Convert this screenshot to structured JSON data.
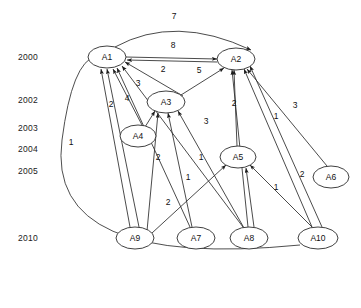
{
  "figure": {
    "type": "directed-graph",
    "title": "",
    "background": "#ffffff",
    "stroke_color": "#2b2b2b"
  },
  "timeline": {
    "axis_label": "",
    "years": [
      {
        "label": "2000",
        "y": 57
      },
      {
        "label": "2002",
        "y": 100
      },
      {
        "label": "2003",
        "y": 128
      },
      {
        "label": "2004",
        "y": 149
      },
      {
        "label": "2005",
        "y": 171
      },
      {
        "label": "2010",
        "y": 238
      }
    ]
  },
  "nodes": [
    {
      "id": "A1",
      "label": "A1",
      "cx": 107,
      "cy": 57,
      "rx": 19,
      "ry": 11,
      "year": "2000"
    },
    {
      "id": "A2",
      "label": "A2",
      "cx": 236,
      "cy": 59,
      "rx": 19,
      "ry": 11,
      "year": "2000"
    },
    {
      "id": "A3",
      "label": "A3",
      "cx": 166,
      "cy": 102,
      "rx": 19,
      "ry": 11,
      "year": "2002"
    },
    {
      "id": "A4",
      "label": "A4",
      "cx": 138,
      "cy": 136,
      "rx": 18,
      "ry": 11,
      "year": "2003"
    },
    {
      "id": "A5",
      "label": "A5",
      "cx": 238,
      "cy": 157,
      "rx": 18,
      "ry": 11,
      "year": "2004"
    },
    {
      "id": "A6",
      "label": "A6",
      "cx": 331,
      "cy": 177,
      "rx": 18,
      "ry": 11,
      "year": "2005"
    },
    {
      "id": "A9",
      "label": "A9",
      "cx": 135,
      "cy": 238,
      "rx": 19,
      "ry": 11,
      "year": "2010"
    },
    {
      "id": "A7",
      "label": "A7",
      "cx": 196,
      "cy": 238,
      "rx": 19,
      "ry": 11,
      "year": "2010"
    },
    {
      "id": "A8",
      "label": "A8",
      "cx": 249,
      "cy": 238,
      "rx": 19,
      "ry": 11,
      "year": "2010"
    },
    {
      "id": "A10",
      "label": "A10",
      "cx": 318,
      "cy": 238,
      "rx": 20,
      "ry": 11,
      "year": "2010"
    }
  ],
  "edges": [
    {
      "from": "A1",
      "to": "A2",
      "weight": "7",
      "label_x": 174,
      "label_y": 19,
      "path": "M 115 47 Q 175 14 251 50",
      "arrow_at": [
        251,
        50
      ],
      "arrow_angle": 38
    },
    {
      "from": "A1",
      "to": "A2",
      "weight": "8",
      "label_x": 173,
      "label_y": 48,
      "path": "M 126 57 L 217 59",
      "arrow_at": [
        217,
        59
      ],
      "arrow_angle": 1
    },
    {
      "from": "A2",
      "to": "A1",
      "weight": "",
      "label_x": 0,
      "label_y": 0,
      "path": "M 217 62 L 127 60",
      "arrow_at": [
        127,
        60
      ],
      "arrow_angle": 181
    },
    {
      "from": "A3",
      "to": "A1",
      "weight": "2",
      "label_x": 163,
      "label_y": 72,
      "path": "M 183 96 L 125 62",
      "arrow_at": [
        125,
        62
      ],
      "arrow_angle": 210
    },
    {
      "from": "A3",
      "to": "A2",
      "weight": "5",
      "label_x": 199,
      "label_y": 73,
      "path": "M 181 95 L 224 68",
      "arrow_at": [
        224,
        68
      ],
      "arrow_angle": 328
    },
    {
      "from": "A4",
      "to": "A1",
      "weight": "3",
      "label_x": 138,
      "label_y": 86,
      "path": "M 142 125 L 113 69",
      "arrow_at": [
        113,
        69
      ],
      "arrow_angle": 243
    },
    {
      "from": "A4",
      "to": "A3",
      "weight": "",
      "label_x": 0,
      "label_y": 0,
      "path": "M 145 127 L 155 111",
      "arrow_at": [
        155,
        111
      ],
      "arrow_angle": 302
    },
    {
      "from": "A9",
      "to": "A1",
      "weight": "2",
      "label_x": 111,
      "label_y": 107,
      "path": "M 130 227 L 101 69",
      "arrow_at": [
        101,
        69
      ],
      "arrow_angle": 243
    },
    {
      "from": "A9",
      "to": "A1",
      "weight": "4",
      "label_x": 127,
      "label_y": 101,
      "path": "M 139 227 L 107 69",
      "arrow_at": [
        107,
        69
      ],
      "arrow_angle": 258
    },
    {
      "from": "A9",
      "to": "A3",
      "weight": "2",
      "label_x": 158,
      "label_y": 160,
      "path": "M 147 231 L 158 113",
      "arrow_at": [
        158,
        113
      ],
      "arrow_angle": 265
    },
    {
      "from": "A7",
      "to": "A1",
      "weight": "",
      "label_x": 0,
      "label_y": 0,
      "path": "M 190 227 L 117 68",
      "arrow_at": [
        117,
        68
      ],
      "arrow_angle": 219
    },
    {
      "from": "A7",
      "to": "A3",
      "weight": "1",
      "label_x": 188,
      "label_y": 180,
      "path": "M 192 227 L 168 113",
      "arrow_at": [
        168,
        113
      ],
      "arrow_angle": 258
    },
    {
      "from": "A8",
      "to": "A1",
      "weight": "3",
      "label_x": 206,
      "label_y": 124,
      "path": "M 243 227 L 122 66",
      "arrow_at": [
        122,
        66
      ],
      "arrow_angle": 233
    },
    {
      "from": "A8",
      "to": "A3",
      "weight": "",
      "label_x": 0,
      "label_y": 0,
      "path": "M 244 228 L 178 111",
      "arrow_at": [
        178,
        111
      ],
      "arrow_angle": 240
    },
    {
      "from": "A8",
      "to": "A2",
      "weight": "2",
      "label_x": 234,
      "label_y": 106,
      "path": "M 248 227 L 232 70",
      "arrow_at": [
        232,
        70
      ],
      "arrow_angle": 254
    },
    {
      "from": "A8",
      "to": "A5",
      "weight": "1",
      "label_x": 276,
      "label_y": 190,
      "path": "M 254 227 L 246 168",
      "arrow_at": [
        246,
        168
      ],
      "arrow_angle": 262
    },
    {
      "from": "A10",
      "to": "A1",
      "weight": "1",
      "label_x": 71,
      "label_y": 145,
      "path": "M 300 245 Q 45 270 62 140 Q 72 62 96 56",
      "arrow_at": [
        96,
        56
      ],
      "arrow_angle": 350
    },
    {
      "from": "A10",
      "to": "A2",
      "weight": "1",
      "label_x": 276,
      "label_y": 119,
      "path": "M 312 227 L 244 69",
      "arrow_at": [
        244,
        69
      ],
      "arrow_angle": 247
    },
    {
      "from": "A10",
      "to": "A2",
      "weight": "3",
      "label_x": 295,
      "label_y": 108,
      "path": "M 322 227 L 250 66",
      "arrow_at": [
        250,
        66
      ],
      "arrow_angle": 246
    },
    {
      "from": "A10",
      "to": "A5",
      "weight": "2",
      "label_x": 302,
      "label_y": 177,
      "path": "M 312 227 L 250 165",
      "arrow_at": [
        250,
        165
      ],
      "arrow_angle": 225
    },
    {
      "from": "A6",
      "to": "A2",
      "weight": "",
      "label_x": 0,
      "label_y": 0,
      "path": "M 327 166 L 247 69",
      "arrow_at": [
        247,
        69
      ],
      "arrow_angle": 230
    },
    {
      "from": "A5",
      "to": "A2",
      "weight": "1",
      "label_x": 201,
      "label_y": 160,
      "path": "M 237 146 L 234 70",
      "arrow_at": [
        234,
        70
      ],
      "arrow_angle": 268
    },
    {
      "from": "A9",
      "to": "A5",
      "weight": "2",
      "label_x": 168,
      "label_y": 205,
      "path": "M 152 233 L 226 165",
      "arrow_at": [
        226,
        165
      ],
      "arrow_angle": 317
    }
  ],
  "edge_weight_values": [
    "7",
    "8",
    "2",
    "5",
    "3",
    "4",
    "2",
    "2",
    "3",
    "1",
    "1",
    "2",
    "1",
    "2",
    "3",
    "1",
    "1"
  ],
  "node_count": 10,
  "edge_count": 23
}
